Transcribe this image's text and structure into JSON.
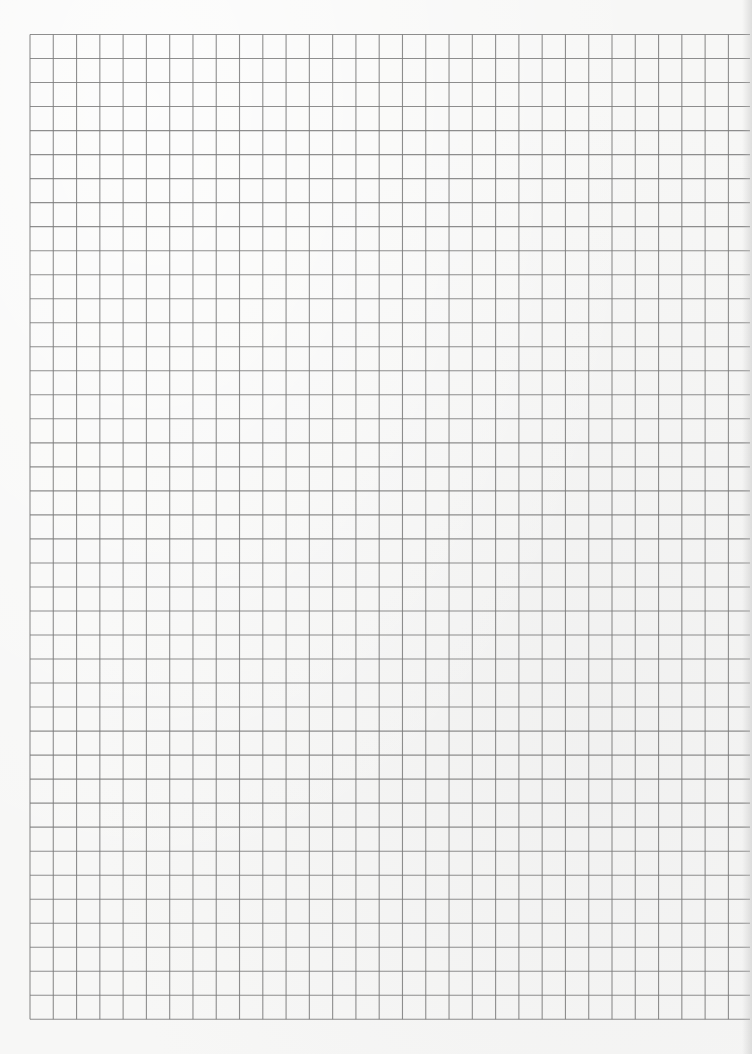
{
  "sheet": {
    "type": "graph-paper",
    "background_color": "#f7f7f6",
    "line_color": "#7a7a7a",
    "grid": {
      "origin_x": 30,
      "origin_y": 34.5,
      "columns": 30,
      "column_width": 23.28,
      "horizontal_line_end_x": 750,
      "rows": 41,
      "row_height": 24.02
    }
  }
}
